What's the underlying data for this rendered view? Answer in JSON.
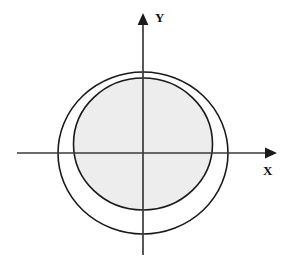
{
  "figure": {
    "title": "",
    "background_color": "#ffffff",
    "width": 291,
    "height": 265,
    "origin": {
      "x": 143,
      "y": 153
    },
    "axes": {
      "x": {
        "label": "X",
        "label_position": {
          "x": 263,
          "y": 164
        },
        "line_color": "#3a3a3a",
        "line_width": 1.6,
        "start": {
          "x": 17,
          "y": 153
        },
        "end": {
          "x": 277,
          "y": 153
        },
        "arrowhead": "right",
        "arrow_icon": "arrow-right-icon"
      },
      "y": {
        "label": "Y",
        "label_position": {
          "x": 155,
          "y": 11
        },
        "line_color": "#3a3a3a",
        "line_width": 1.6,
        "start": {
          "x": 143,
          "y": 255
        },
        "end": {
          "x": 143,
          "y": 13
        },
        "arrowhead": "up",
        "arrow_icon": "arrow-up-icon"
      }
    },
    "shapes": [
      {
        "name": "outer-circle",
        "type": "circle",
        "center": {
          "x": 143,
          "y": 153
        },
        "radius_x": 85,
        "radius_y": 81,
        "stroke": "#1a1a1a",
        "stroke_width": 1.6,
        "fill": "#ffffff"
      },
      {
        "name": "inner-circle",
        "type": "circle",
        "center": {
          "x": 143,
          "y": 144
        },
        "radius_x": 69.5,
        "radius_y": 66,
        "stroke": "#1a1a1a",
        "stroke_width": 1.6,
        "fill": "#ededed"
      }
    ],
    "colors": {
      "stroke": "#1a1a1a",
      "axis": "#3a3a3a",
      "inner_fill": "#ededed",
      "ring_fill": "#ffffff",
      "label_text": "#111111"
    }
  }
}
